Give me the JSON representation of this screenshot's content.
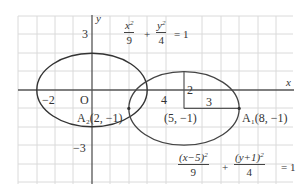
{
  "diagram": {
    "type": "conic-translation",
    "axes": {
      "x_label": "x",
      "y_label": "y",
      "origin_label": "O",
      "tick_labels": {
        "x_neg2": "−2",
        "x_4": "4",
        "y_3": "3",
        "y_neg3": "−3"
      }
    },
    "ellipse1": {
      "equation_x_num": "x",
      "equation_x_den": "9",
      "equation_y_num": "y",
      "equation_y_den": "4",
      "plus": "+",
      "equals": "= 1",
      "center": [
        0,
        0
      ],
      "a": 3,
      "b": 2
    },
    "ellipse2": {
      "equation_x_num": "(x−5)",
      "equation_x_den": "9",
      "equation_y_num": "(y+1)",
      "equation_y_den": "4",
      "plus": "+",
      "equals": "= 1",
      "center": [
        5,
        -1
      ],
      "a": 3,
      "b": 2
    },
    "annotations": {
      "semi_minor": "2",
      "semi_major": "3",
      "center_label": "(5, −1)",
      "vertex1_label": "A₁(8, −1)",
      "vertex2_label": "A₂(2, −1)"
    },
    "points": {
      "A1": [
        8,
        -1
      ],
      "A2": [
        2,
        -1
      ],
      "center2": [
        5,
        -1
      ]
    },
    "colors": {
      "grid": "#d8d8d8",
      "axis": "#555555",
      "curve": "#333333",
      "text": "#333333"
    }
  }
}
